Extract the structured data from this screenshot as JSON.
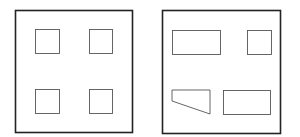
{
  "figure": {
    "background": "#ffffff",
    "stroke_color": "#222222",
    "panels": [
      {
        "name": "left-panel",
        "frame": {
          "x": 15,
          "y": 10,
          "w": 117,
          "h": 122
        },
        "shapes": [
          {
            "type": "rect",
            "name": "square-top-left",
            "x": 35,
            "y": 29,
            "w": 24,
            "h": 24
          },
          {
            "type": "rect",
            "name": "square-top-right",
            "x": 89,
            "y": 29,
            "w": 23,
            "h": 24
          },
          {
            "type": "rect",
            "name": "square-bottom-left",
            "x": 35,
            "y": 89,
            "w": 24,
            "h": 24
          },
          {
            "type": "rect",
            "name": "square-bottom-right",
            "x": 89,
            "y": 89,
            "w": 23,
            "h": 24
          }
        ]
      },
      {
        "name": "right-panel",
        "frame": {
          "x": 162,
          "y": 10,
          "w": 118,
          "h": 123
        },
        "shapes": [
          {
            "type": "rect",
            "name": "rectangle-top-left",
            "x": 172,
            "y": 30,
            "w": 48,
            "h": 24
          },
          {
            "type": "rect",
            "name": "square-top-right",
            "x": 247,
            "y": 30,
            "w": 24,
            "h": 24
          },
          {
            "type": "polygon",
            "name": "trapezoid-bottom-left",
            "points": "172,90 210,90 210,114 172,101"
          },
          {
            "type": "rect",
            "name": "rectangle-bottom-right",
            "x": 223,
            "y": 90,
            "w": 47,
            "h": 24
          }
        ]
      }
    ]
  }
}
